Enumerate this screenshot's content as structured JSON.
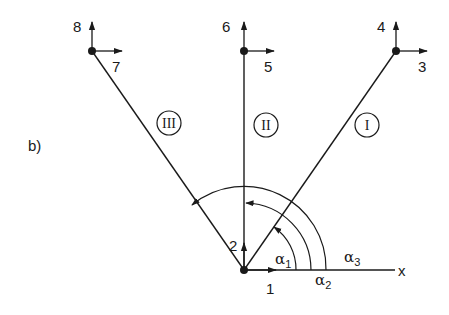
{
  "figure_label": "b)",
  "axis": {
    "label": "x"
  },
  "members": [
    {
      "id": "I",
      "label": "I"
    },
    {
      "id": "II",
      "label": "II"
    },
    {
      "id": "III",
      "label": "III"
    }
  ],
  "dofs": {
    "origin": {
      "horizontal": "1",
      "vertical": "2"
    },
    "node_I": {
      "horizontal": "3",
      "vertical": "4"
    },
    "node_II": {
      "horizontal": "5",
      "vertical": "6"
    },
    "node_III": {
      "horizontal": "7",
      "vertical": "8"
    }
  },
  "angles": [
    {
      "symbol": "α",
      "sub": "1"
    },
    {
      "symbol": "α",
      "sub": "2"
    },
    {
      "symbol": "α",
      "sub": "3"
    }
  ],
  "colors": {
    "ink": "#1a1a1a",
    "background": "#ffffff"
  }
}
